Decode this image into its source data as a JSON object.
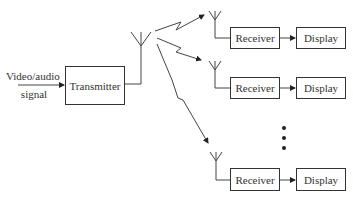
{
  "input": {
    "label_line1": "Video/audio",
    "label_line2": "signal"
  },
  "transmitter": {
    "label": "Transmitter"
  },
  "receivers": [
    {
      "receiver_label": "Receiver",
      "display_label": "Display"
    },
    {
      "receiver_label": "Receiver",
      "display_label": "Display"
    },
    {
      "receiver_label": "Receiver",
      "display_label": "Display"
    }
  ],
  "colors": {
    "stroke": "#333333",
    "background": "#ffffff"
  }
}
